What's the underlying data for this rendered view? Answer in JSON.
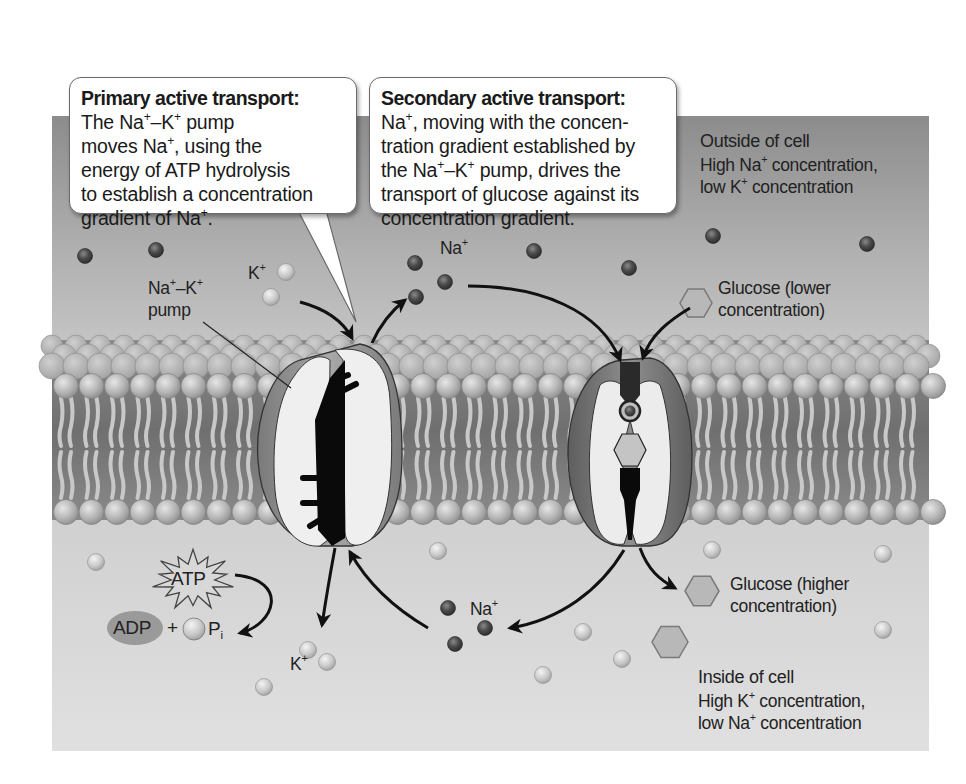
{
  "diagram": {
    "callouts": {
      "primary": {
        "title": "Primary active transport:",
        "lines": [
          "The Na⁺–K⁺ pump",
          "moves Na⁺, using the",
          "energy of ATP hydrolysis",
          "to establish a concentration",
          "gradient of Na⁺."
        ]
      },
      "secondary": {
        "title": "Secondary active transport:",
        "lines": [
          "Na⁺, moving with the concen-",
          "tration gradient established by",
          "the Na⁺–K⁺ pump, drives the",
          "transport of glucose against its",
          "concentration gradient."
        ]
      }
    },
    "regions": {
      "outside": {
        "heading": "Outside of cell",
        "line1": "High Na⁺ concentration,",
        "line2": "low K⁺ concentration"
      },
      "inside": {
        "heading": "Inside of cell",
        "line1": "High K⁺ concentration,",
        "line2": "low Na⁺ concentration"
      }
    },
    "labels": {
      "pump_line1": "Na⁺–K⁺",
      "pump_line2": "pump",
      "k_outside": "K⁺",
      "na_outside": "Na⁺",
      "glucose_lower_1": "Glucose (lower",
      "glucose_lower_2": "concentration)",
      "glucose_higher_1": "Glucose (higher",
      "glucose_higher_2": "concentration)",
      "atp": "ATP",
      "adp": "ADP",
      "plus": "+",
      "pi": "Pᵢ",
      "k_inside": "K⁺",
      "na_inside": "Na⁺"
    },
    "legend_symbols": {
      "sodium_ion": "dark-sphere",
      "potassium_ion": "light-sphere",
      "glucose": "hexagon"
    },
    "colors": {
      "outside_top": "#8f8f8f",
      "outside_bottom": "#c4c4c4",
      "inside": "#dcdcdc",
      "sodium": "#4a4a4a",
      "potassium": "#c9c9c9",
      "protein_interior": "#0a0a0a",
      "callout_bg": "#ffffff"
    }
  }
}
